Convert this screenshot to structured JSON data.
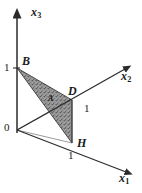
{
  "figure": {
    "type": "3d-coordinate-diagram",
    "background_color": "#ffffff",
    "line_color": "#2b2b2b",
    "fill_color": "#8a8a8a",
    "axes": [
      {
        "name": "x3",
        "label_base": "x",
        "label_sub": "3",
        "direction": "up"
      },
      {
        "name": "x2",
        "label_base": "x",
        "label_sub": "2",
        "direction": "up-right"
      },
      {
        "name": "x1",
        "label_base": "x",
        "label_sub": "1",
        "direction": "down-right"
      }
    ],
    "origin_label": "0",
    "ticks": [
      {
        "axis": "x3",
        "value": "1"
      },
      {
        "axis": "x2",
        "value": "1"
      },
      {
        "axis": "x1",
        "value": "1"
      }
    ],
    "points": [
      {
        "name": "B",
        "label": "B",
        "axis": "x3",
        "coord": "(0,0,1)"
      },
      {
        "name": "D",
        "label": "D",
        "axis": "x2",
        "coord": "(0,1,0)"
      },
      {
        "name": "H",
        "label": "H",
        "axis": "x1",
        "coord": "(1,0,0)"
      },
      {
        "name": "A",
        "label": "A",
        "axis": "interior",
        "coord": "interior"
      }
    ],
    "shaded_region": {
      "name": "triangle-BDH",
      "vertices": [
        "B",
        "D",
        "H"
      ],
      "shading": "stippled-gray"
    }
  }
}
